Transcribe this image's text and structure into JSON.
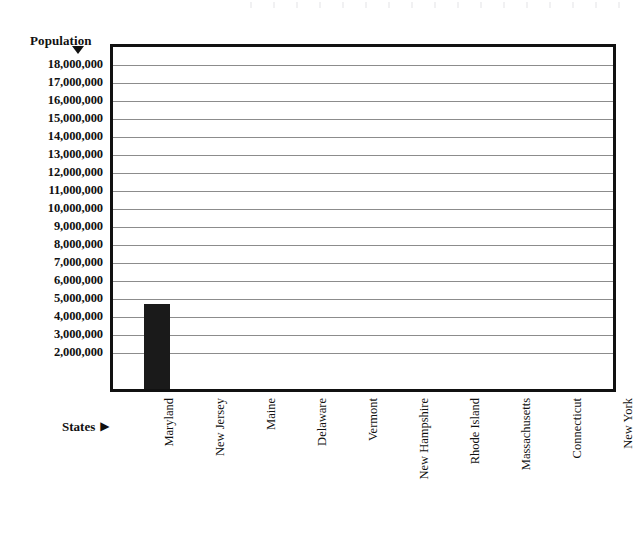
{
  "chart_data": {
    "type": "bar",
    "title": "",
    "xlabel": "States",
    "ylabel": "Population",
    "categories": [
      "Maryland",
      "New Jersey",
      "Maine",
      "Delaware",
      "Vermont",
      "New Hampshire",
      "Rhode Island",
      "Massachusetts",
      "Connecticut",
      "New York"
    ],
    "values": [
      4700000,
      0,
      0,
      0,
      0,
      0,
      0,
      0,
      0,
      0
    ],
    "ylim": [
      0,
      19000000
    ],
    "ytick_values": [
      18000000,
      17000000,
      16000000,
      15000000,
      14000000,
      13000000,
      12000000,
      11000000,
      10000000,
      9000000,
      8000000,
      7000000,
      6000000,
      5000000,
      4000000,
      3000000,
      2000000
    ],
    "ytick_labels": [
      "18,000,000",
      "17,000,000",
      "16,000,000",
      "15,000,000",
      "14,000,000",
      "13,000,000",
      "12,000,000",
      "11,000,000",
      "10,000,000",
      "9,000,000",
      "8,000,000",
      "7,000,000",
      "6,000,000",
      "5,000,000",
      "4,000,000",
      "3,000,000",
      "2,000,000"
    ],
    "grid": true,
    "legend": false,
    "bar_color": "#1a1a1a",
    "axis_color": "#111111",
    "grid_color": "#8c8c8c"
  },
  "axes": {
    "y_axis_title": "Population",
    "y_axis_arrow_glyph": "▼",
    "x_axis_title": "States",
    "x_axis_arrow_glyph": "▶"
  }
}
